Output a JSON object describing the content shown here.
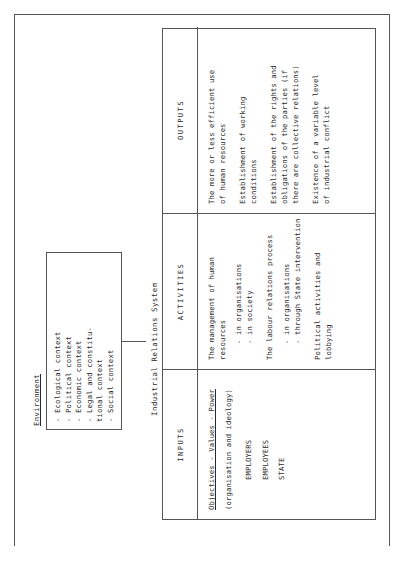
{
  "diagram": {
    "title_label": "Industrial Relations System",
    "environment": {
      "label": "Environment",
      "items": [
        "-  Ecological context",
        "-  Political context",
        "-  Economic context",
        "-  Legal and constitu-",
        "   tional context",
        "-  Social context"
      ]
    },
    "columns": [
      {
        "header": "INPUTS",
        "lines": [
          "Objectives - Values - Power",
          "(organisation and ideology)",
          "EMPLOYERS",
          "EMPLOYEES",
          "STATE"
        ]
      },
      {
        "header": "ACTIVITIES",
        "lines": [
          "The management of human",
          "resources",
          "- in organisations",
          "- in society",
          "The labour relations process",
          "- in organisations",
          "- through State intervention",
          "Political activities and",
          "lobbying"
        ]
      },
      {
        "header": "OUTPUTS",
        "lines": [
          "The more or less efficient use",
          "of human resources",
          "Establishment of working",
          "conditions",
          "Establishment of the rights and",
          "obligations of the parties (if",
          "there are collective relations)",
          "Existence of a variable level",
          "of industrial conflict"
        ]
      }
    ]
  }
}
